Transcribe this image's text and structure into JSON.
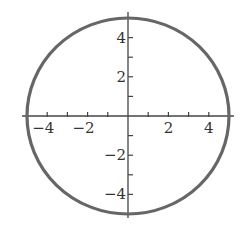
{
  "chart_data": {
    "type": "line",
    "title": "",
    "xlabel": "",
    "ylabel": "",
    "series": [
      {
        "name": "circle",
        "shape": "circle",
        "center": [
          0,
          0
        ],
        "radius": 5
      }
    ],
    "xlim": [
      -5.2,
      5.2
    ],
    "ylim": [
      -5.2,
      5.2
    ],
    "x_ticks": [
      -5,
      -4,
      -3,
      -2,
      -1,
      1,
      2,
      3,
      4,
      5
    ],
    "y_ticks": [
      -5,
      -4,
      -3,
      -2,
      -1,
      1,
      2,
      3,
      4,
      5
    ],
    "x_tick_labels": [
      {
        "value": -4,
        "text": "−4"
      },
      {
        "value": -2,
        "text": "−2"
      },
      {
        "value": 2,
        "text": "2"
      },
      {
        "value": 4,
        "text": "4"
      }
    ],
    "y_tick_labels": [
      {
        "value": 4,
        "text": "4"
      },
      {
        "value": 2,
        "text": "2"
      },
      {
        "value": -2,
        "text": "−2"
      },
      {
        "value": -4,
        "text": "−4"
      }
    ],
    "grid": false,
    "legend": null,
    "colors": {
      "curve": "#666666",
      "axes": "#444444"
    }
  }
}
